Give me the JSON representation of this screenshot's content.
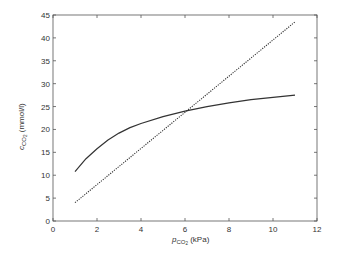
{
  "chart_data": {
    "type": "line",
    "title": "",
    "xlabel": "p_CO2 (kPa)",
    "xlabel_main": "p",
    "xlabel_sub": "CO",
    "xlabel_subsub": "2",
    "xlabel_unit": " (kPa)",
    "ylabel": "c_CO2 (mmol/l)",
    "ylabel_main": "c",
    "ylabel_sub": "CO",
    "ylabel_subsub": "2",
    "ylabel_unit": " (mmol/l)",
    "xlim": [
      0,
      12
    ],
    "ylim": [
      0,
      45
    ],
    "xticks": [
      0,
      2,
      4,
      6,
      8,
      10,
      12
    ],
    "yticks": [
      0,
      5,
      10,
      15,
      20,
      25,
      30,
      35,
      40,
      45
    ],
    "grid": false,
    "legend": null,
    "series": [
      {
        "name": "CO2 dissociation curve",
        "style": "solid",
        "color": "#333333",
        "x": [
          1,
          1.5,
          2,
          2.5,
          3,
          3.5,
          4,
          5,
          6,
          7,
          8,
          9,
          10,
          11
        ],
        "y": [
          10.8,
          13.6,
          15.8,
          17.7,
          19.2,
          20.4,
          21.3,
          22.8,
          24.0,
          25.0,
          25.8,
          26.5,
          27.0,
          27.5
        ]
      },
      {
        "name": "Linear relationship",
        "style": "dotted",
        "color": "#333333",
        "x": [
          1,
          11
        ],
        "y": [
          4.0,
          43.5
        ]
      }
    ]
  }
}
